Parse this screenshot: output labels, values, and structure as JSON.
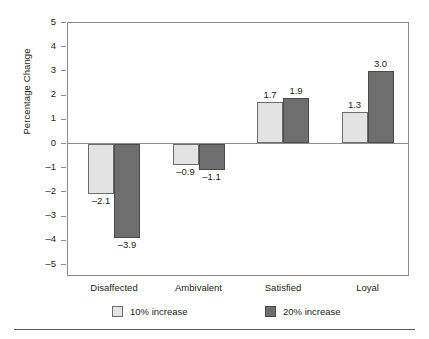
{
  "chart_data": {
    "type": "bar",
    "title": "",
    "subtitle": "",
    "xlabel": "",
    "ylabel": "Percentage Change",
    "ylim": [
      -5,
      5
    ],
    "ytick_labels": [
      "5",
      "4",
      "3",
      "2",
      "1",
      "0",
      "–1",
      "–2",
      "–3",
      "–4",
      "–5"
    ],
    "ytick_values": [
      5,
      4,
      3,
      2,
      1,
      0,
      -1,
      -2,
      -3,
      -4,
      -5
    ],
    "grid": false,
    "legend_position": "bottom",
    "categories": [
      "Disaffected",
      "Ambivalent",
      "Satisfied",
      "Loyal"
    ],
    "series": [
      {
        "name": "10% increase",
        "color": "#e3e3e3",
        "values": [
          -2.1,
          -0.9,
          1.7,
          1.3
        ],
        "labels": [
          "–2.1",
          "–0.9",
          "1.7",
          "1.3"
        ]
      },
      {
        "name": "20% increase",
        "color": "#6e6e6e",
        "values": [
          -3.9,
          -1.1,
          1.9,
          3.0
        ],
        "labels": [
          "–3.9",
          "–1.1",
          "1.9",
          "3.0"
        ]
      }
    ]
  },
  "legend": {
    "items": [
      {
        "label": "10% increase",
        "swatch": "light"
      },
      {
        "label": "20% increase",
        "swatch": "dark"
      }
    ]
  },
  "colors": {
    "series_light": "#e3e3e3",
    "series_dark": "#6e6e6e",
    "axis": "#8d8d8d",
    "text": "#231f20",
    "rule": "#5a5a5a"
  }
}
